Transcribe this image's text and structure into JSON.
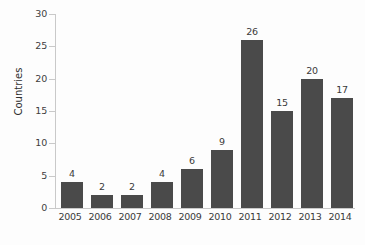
{
  "chart_data": {
    "type": "bar",
    "title": "",
    "xlabel": "",
    "ylabel": "Countries",
    "categories": [
      "2005",
      "2006",
      "2007",
      "2008",
      "2009",
      "2010",
      "2011",
      "2012",
      "2013",
      "2014"
    ],
    "values": [
      4,
      2,
      2,
      4,
      6,
      9,
      26,
      15,
      20,
      17
    ],
    "value_labels": [
      "4",
      "2",
      "2",
      "4",
      "6",
      "9",
      "26",
      "15",
      "20",
      "17"
    ],
    "ylim": [
      0,
      30
    ],
    "ytick_values": [
      0,
      5,
      10,
      15,
      20,
      25,
      30
    ],
    "ytick_labels": [
      "0",
      "5",
      "10",
      "15",
      "20",
      "25",
      "30"
    ],
    "grid": false,
    "legend": null,
    "bar_color": "#4a4a4a",
    "axis_color": "#c9c9c9",
    "text_color": "#3a3a3a",
    "background": "#fdfdfd"
  }
}
